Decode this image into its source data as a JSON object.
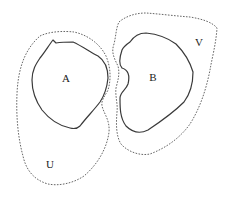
{
  "diagram": {
    "title": "",
    "regions": [
      {
        "id": "A",
        "label": "A",
        "style": "solid",
        "description": "Inner closed region A"
      },
      {
        "id": "U",
        "label": "U",
        "style": "dotted",
        "description": "Neighborhood U enclosing A"
      },
      {
        "id": "B",
        "label": "B",
        "style": "solid",
        "description": "Inner closed region B with indentation facing A"
      },
      {
        "id": "V",
        "label": "V",
        "style": "dotted",
        "description": "Neighborhood V enclosing B"
      }
    ],
    "labels": {
      "A": "A",
      "B": "B",
      "U": "U",
      "V": "V"
    },
    "relations": [
      "A ⊂ U",
      "B ⊂ V",
      "U ∩ V = ∅"
    ],
    "colors": {
      "solid_stroke": "#3a3a3a",
      "dotted_stroke": "#555555",
      "background": "#ffffff"
    }
  }
}
